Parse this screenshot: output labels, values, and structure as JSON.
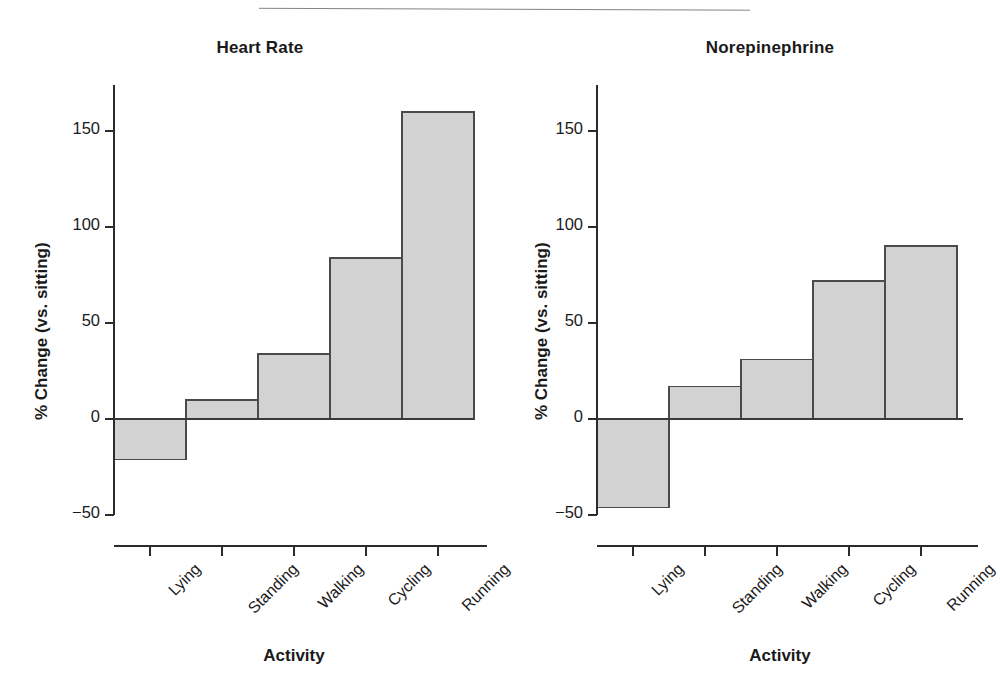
{
  "figure": {
    "background": "#ffffff",
    "bar_fill": "#d2d2d2",
    "bar_stroke": "#4a4a4a",
    "axis_color": "#2b2b2b",
    "text_color": "#1a1a1a"
  },
  "chart_data": [
    {
      "type": "bar",
      "title": "Heart Rate",
      "xlabel": "Activity",
      "ylabel": "% Change (vs. sitting)",
      "categories": [
        "Lying",
        "Standing",
        "Walking",
        "Cycling",
        "Running"
      ],
      "values": [
        -21,
        10,
        34,
        84,
        160
      ],
      "ylim": [
        -68,
        172
      ],
      "yticks": [
        -50,
        0,
        50,
        100,
        150
      ],
      "ytick_labels": [
        "−50",
        "0",
        "50",
        "100",
        "150"
      ],
      "grid": false,
      "legend": "none",
      "bar_style": "adjacent-histogram",
      "xtick_label_rotation": -45
    },
    {
      "type": "bar",
      "title": "Norepinephrine",
      "xlabel": "Activity",
      "ylabel": "% Change (vs. sitting)",
      "categories": [
        "Lying",
        "Standing",
        "Walking",
        "Cycling",
        "Running"
      ],
      "values": [
        -46,
        17,
        31,
        72,
        90
      ],
      "ylim": [
        -68,
        172
      ],
      "yticks": [
        -50,
        0,
        50,
        100,
        150
      ],
      "ytick_labels": [
        "−50",
        "0",
        "50",
        "100",
        "150"
      ],
      "grid": false,
      "legend": "none",
      "bar_style": "adjacent-histogram",
      "xtick_label_rotation": -45
    }
  ],
  "panels": {
    "left": {
      "title": "Heart Rate",
      "ylabel": "% Change (vs. sitting)",
      "xlabel": "Activity",
      "ytick_labels": [
        "150",
        "100",
        "50",
        "0",
        "−50"
      ],
      "categories": [
        "Lying",
        "Standing",
        "Walking",
        "Cycling",
        "Running"
      ]
    },
    "right": {
      "title": "Norepinephrine",
      "ylabel": "% Change (vs. sitting)",
      "xlabel": "Activity",
      "ytick_labels": [
        "150",
        "100",
        "50",
        "0",
        "−50"
      ],
      "categories": [
        "Lying",
        "Standing",
        "Walking",
        "Cycling",
        "Running"
      ]
    }
  }
}
